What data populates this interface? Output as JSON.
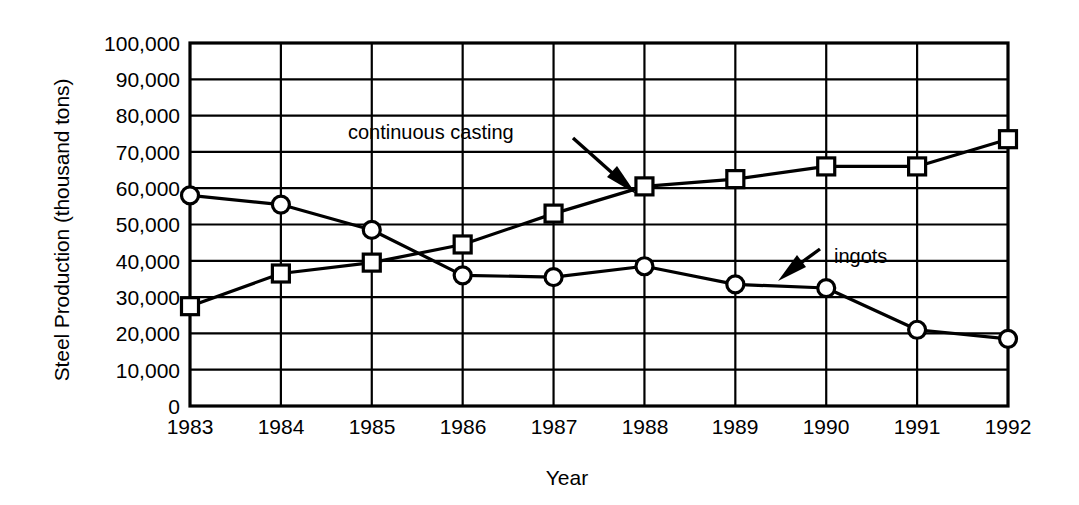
{
  "chart_data": {
    "type": "line",
    "title": "",
    "xlabel": "Year",
    "ylabel": "Steel Production (thousand tons)",
    "categories": [
      "1983",
      "1984",
      "1985",
      "1986",
      "1987",
      "1988",
      "1989",
      "1990",
      "1991",
      "1992"
    ],
    "x": [
      1983,
      1984,
      1985,
      1986,
      1987,
      1988,
      1989,
      1990,
      1991,
      1992
    ],
    "xlim": [
      1983,
      1992
    ],
    "ylim": [
      0,
      100000
    ],
    "ytick_labels": [
      "100,000",
      "90,000",
      "80,000",
      "70,000",
      "60,000",
      "50,000",
      "40,000",
      "30,000",
      "20,000",
      "10,000",
      "0"
    ],
    "ytick_values": [
      100000,
      90000,
      80000,
      70000,
      60000,
      50000,
      40000,
      30000,
      20000,
      10000,
      0
    ],
    "grid": "both",
    "legend_position": "inline-annotations",
    "series": [
      {
        "name": "ingots",
        "marker": "circle",
        "values": [
          58000,
          55500,
          48500,
          36000,
          35500,
          38500,
          33500,
          32500,
          21000,
          18500
        ]
      },
      {
        "name": "continuous casting",
        "marker": "square",
        "values": [
          27500,
          36500,
          39500,
          44500,
          53000,
          60500,
          62500,
          66000,
          66000,
          73500
        ]
      }
    ],
    "annotations": [
      {
        "text": "continuous casting",
        "target_series": "continuous casting",
        "arrow": "down-right"
      },
      {
        "text": "ingots",
        "target_series": "ingots",
        "arrow": "down-left"
      }
    ],
    "colors": {
      "line": "#000000",
      "marker_fill": "#ffffff",
      "grid": "#000000",
      "background": "#ffffff"
    }
  }
}
